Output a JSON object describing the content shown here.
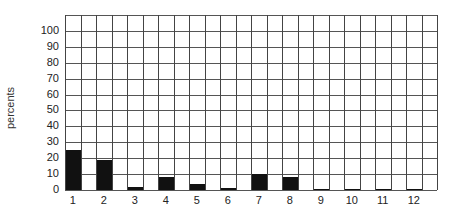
{
  "chart_data": {
    "type": "bar",
    "title": "",
    "xlabel": "",
    "ylabel": "percents",
    "categories": [
      "1",
      "2",
      "3",
      "4",
      "5",
      "6",
      "7",
      "8",
      "9",
      "10",
      "11",
      "12"
    ],
    "values": [
      25,
      19,
      2,
      8,
      4,
      1,
      10,
      8,
      0.5,
      0.5,
      0.5,
      0.5
    ],
    "ylim": [
      0,
      110
    ],
    "yticks": [
      0,
      10,
      20,
      30,
      40,
      50,
      60,
      70,
      80,
      90,
      100
    ],
    "ytick_labels": [
      "0",
      "10",
      "20",
      "30",
      "40",
      "50",
      "60",
      "70",
      "80",
      "90",
      "100"
    ],
    "grid": true,
    "legend": null,
    "bar_color": "#111111",
    "grid_color": "#555555"
  }
}
